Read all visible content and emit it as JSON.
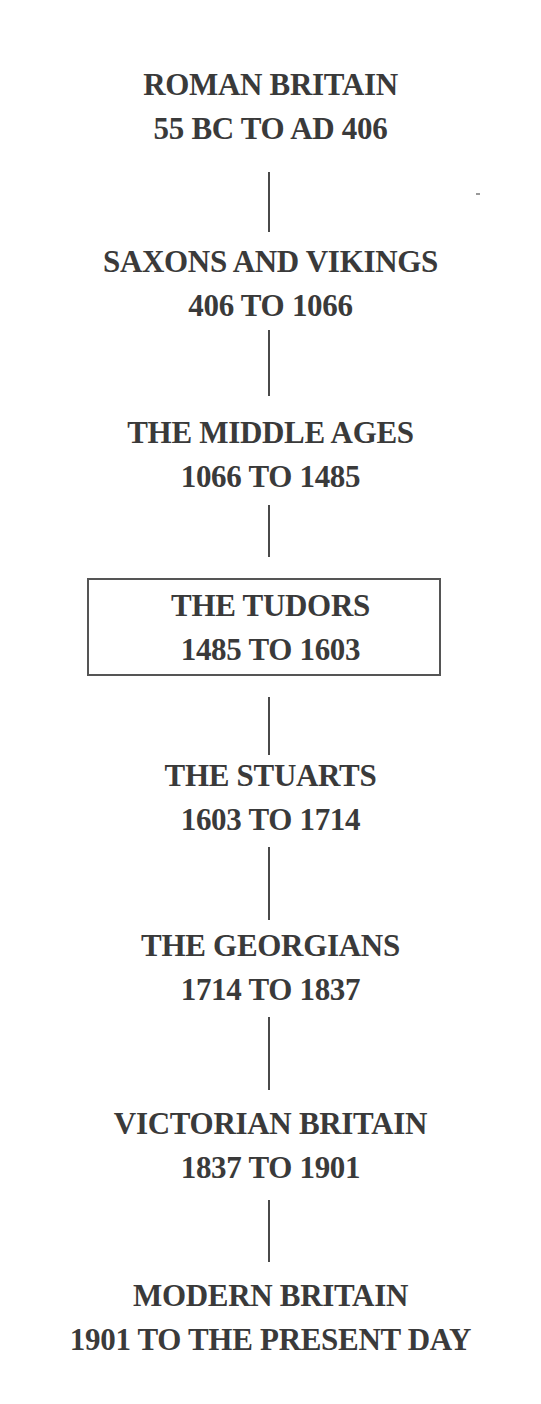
{
  "timeline": {
    "periods": [
      {
        "name": "ROMAN BRITAIN",
        "dates": "55 BC TO AD 406",
        "highlighted": false
      },
      {
        "name": "SAXONS AND VIKINGS",
        "dates": "406 TO 1066",
        "highlighted": false
      },
      {
        "name": "THE MIDDLE AGES",
        "dates": "1066 TO 1485",
        "highlighted": false
      },
      {
        "name": "THE TUDORS",
        "dates": "1485 TO 1603",
        "highlighted": true
      },
      {
        "name": "THE STUARTS",
        "dates": "1603 TO 1714",
        "highlighted": false
      },
      {
        "name": "THE GEORGIANS",
        "dates": "1714 TO 1837",
        "highlighted": false
      },
      {
        "name": "VICTORIAN BRITAIN",
        "dates": "1837 TO 1901",
        "highlighted": false
      },
      {
        "name": "MODERN BRITAIN",
        "dates": "1901 TO THE PRESENT DAY",
        "highlighted": false
      }
    ]
  },
  "colors": {
    "text": "#3a3a3a",
    "connector": "#4a4a4a",
    "box_border": "#555555",
    "background": "#ffffff"
  }
}
